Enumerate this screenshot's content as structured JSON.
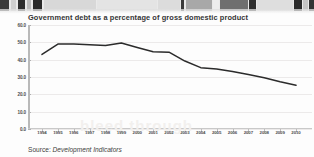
{
  "figure": {
    "title": "Government debt as a percentage of gross domestic product",
    "source_prefix": "Source:",
    "source_name": "Development Indicators",
    "ghost_text": "bleed through"
  },
  "colors": {
    "line": "#2b2b2b",
    "axis": "#b9b9b9",
    "grid": "#eceaea",
    "text": "#343434",
    "background": "#fdfdfd"
  },
  "chart_data": {
    "type": "line",
    "title": "Government debt as a percentage of gross domestic product",
    "xlabel": "",
    "ylabel": "",
    "ylim": [
      0.0,
      60.0
    ],
    "grid": true,
    "legend": "none",
    "ytick_labels": [
      "60.0",
      "50.0",
      "40.0",
      "30.0",
      "20.0",
      "10.0",
      "0.0"
    ],
    "ytick_values": [
      60.0,
      50.0,
      40.0,
      30.0,
      20.0,
      10.0,
      0.0
    ],
    "categories": [
      "1994",
      "1995",
      "1996",
      "1997",
      "1998",
      "1999",
      "2000",
      "2001",
      "2002",
      "2003",
      "2004",
      "2005",
      "2006",
      "2007",
      "2008",
      "2009",
      "2010"
    ],
    "values": [
      43.0,
      49.0,
      49.0,
      48.6,
      48.2,
      49.6,
      47.0,
      44.6,
      44.3,
      39.2,
      35.4,
      34.6,
      33.2,
      31.4,
      29.6,
      27.2,
      25.2
    ],
    "series": [
      {
        "name": "Government debt (% of GDP)",
        "values": [
          43.0,
          49.0,
          49.0,
          48.6,
          48.2,
          49.6,
          47.0,
          44.6,
          44.3,
          39.2,
          35.4,
          34.6,
          33.2,
          31.4,
          29.6,
          27.2,
          25.2
        ]
      }
    ]
  },
  "scan_artifacts": [
    {
      "x": 0,
      "w": 9,
      "shade": "#3a3a3a"
    },
    {
      "x": 11,
      "w": 5,
      "shade": "#cfcfcf"
    },
    {
      "x": 18,
      "w": 7,
      "shade": "#2e2e2e"
    },
    {
      "x": 27,
      "w": 4,
      "shade": "#bdbdbd"
    },
    {
      "x": 33,
      "w": 9,
      "shade": "#2a2a2a"
    },
    {
      "x": 44,
      "w": 52,
      "shade": "#d8d8d8"
    },
    {
      "x": 97,
      "w": 60,
      "shade": "#e4e4e4"
    },
    {
      "x": 158,
      "w": 22,
      "shade": "#dcdcdc"
    },
    {
      "x": 181,
      "w": 3,
      "shade": "#3b3b3b"
    },
    {
      "x": 186,
      "w": 26,
      "shade": "#a8a8a8"
    },
    {
      "x": 213,
      "w": 6,
      "shade": "#ededed"
    },
    {
      "x": 220,
      "w": 28,
      "shade": "#6f6f6f"
    },
    {
      "x": 249,
      "w": 7,
      "shade": "#2f2f2f"
    },
    {
      "x": 257,
      "w": 36,
      "shade": "#dedede"
    },
    {
      "x": 294,
      "w": 8,
      "shade": "#2b2b2b"
    },
    {
      "x": 303,
      "w": 5,
      "shade": "#c5c5c5"
    },
    {
      "x": 309,
      "w": 5,
      "shade": "#343434"
    }
  ]
}
